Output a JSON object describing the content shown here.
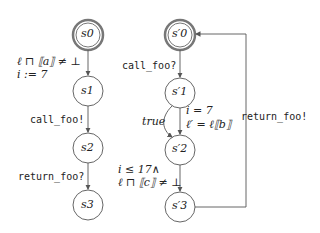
{
  "diagram": {
    "left_automaton": {
      "states": [
        {
          "id": "s0",
          "label": "s0",
          "initial": true
        },
        {
          "id": "s1",
          "label": "s1"
        },
        {
          "id": "s2",
          "label": "s2"
        },
        {
          "id": "s3",
          "label": "s3"
        }
      ],
      "transitions": [
        {
          "from": "s0",
          "to": "s1",
          "label_line1": "ℓ ⊓ ⟦a⟧ ≠ ⊥",
          "label_line2": "i := 7"
        },
        {
          "from": "s1",
          "to": "s2",
          "label": "call_foo!"
        },
        {
          "from": "s2",
          "to": "s3",
          "label": "return_foo?"
        }
      ]
    },
    "right_automaton": {
      "states": [
        {
          "id": "s0p",
          "label": "s′0",
          "initial": true
        },
        {
          "id": "s1p",
          "label": "s′1"
        },
        {
          "id": "s2p",
          "label": "s′2"
        },
        {
          "id": "s3p",
          "label": "s′3"
        }
      ],
      "transitions": [
        {
          "from": "s0p",
          "to": "s1p",
          "label": "call_foo?"
        },
        {
          "from": "s1p",
          "to": "s2p",
          "label": "true",
          "kind": "curved-left"
        },
        {
          "from": "s1p",
          "to": "s2p",
          "label_line1": "i = 7",
          "label_line2": "ℓ′ = ℓ⟦b⟧"
        },
        {
          "from": "s2p",
          "to": "s3p",
          "label_line1": "i ≤ 17∧",
          "label_line2": "ℓ ⊓ ⟦c⟧ ≠ ⊥"
        },
        {
          "from": "s3p",
          "to": "s0p",
          "label": "return_foo!",
          "kind": "feedback"
        }
      ]
    }
  }
}
